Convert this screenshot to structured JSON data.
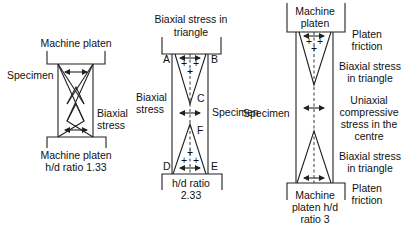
{
  "diagram1": {
    "top_label": "Machine platen",
    "specimen_label": "Specimen",
    "stress_label_1": "Biaxial",
    "stress_label_2": "stress",
    "bottom_label_1": "Machine platen",
    "bottom_label_2": "h/d ratio 1.33"
  },
  "diagram2": {
    "top_label_1": "Biaxial stress in",
    "top_label_2": "triangle",
    "corner_a": "A",
    "corner_b": "B",
    "corner_c": "C",
    "corner_d": "D",
    "corner_e": "E",
    "corner_f": "F",
    "left_label_1": "Biaxial",
    "left_label_2": "stress",
    "right_label": "Specimen",
    "bottom_label_1": "h/d ratio",
    "bottom_label_2": "2.33"
  },
  "diagram3": {
    "top_label_1": "Machine",
    "top_label_2": "platen",
    "specimen_label": "Specimen",
    "r1_1": "Platen",
    "r1_2": "friction",
    "r2_1": "Biaxial stress",
    "r2_2": "in triangle",
    "r3_1": "Uniaxial",
    "r3_2": "compressive",
    "r3_3": "stress in the",
    "r3_4": "centre",
    "r4_1": "Biaxial stress",
    "r4_2": "in triangle",
    "r5_1": "Platen",
    "r5_2": "friction",
    "bottom_label_1": "Machine",
    "bottom_label_2": "platen h/d",
    "bottom_label_3": "ratio 3"
  },
  "symbols": {
    "plus": "+"
  }
}
